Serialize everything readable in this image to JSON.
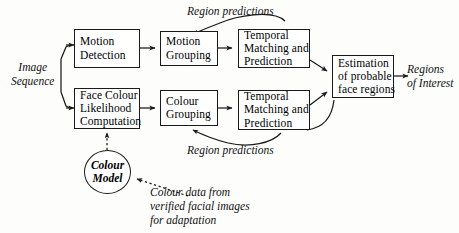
{
  "diagram": {
    "background_color": "#fdfdfb",
    "line_color": "#1a1a1a",
    "nodes": [
      {
        "id": "motion-detection",
        "shape": "box",
        "lines": [
          "Motion",
          "Detection"
        ]
      },
      {
        "id": "motion-grouping",
        "shape": "box",
        "lines": [
          "Motion",
          "Grouping"
        ]
      },
      {
        "id": "temporal-matching-top",
        "shape": "box",
        "lines": [
          "Temporal",
          "Matching and",
          "Prediction"
        ]
      },
      {
        "id": "face-colour-likelihood",
        "shape": "box",
        "lines": [
          "Face Colour",
          "Likelihood",
          "Computation"
        ]
      },
      {
        "id": "colour-grouping",
        "shape": "box",
        "lines": [
          "Colour",
          "Grouping"
        ]
      },
      {
        "id": "temporal-matching-bottom",
        "shape": "box",
        "lines": [
          "Temporal",
          "Matching and",
          "Prediction"
        ]
      },
      {
        "id": "estimation",
        "shape": "box",
        "lines": [
          "Estimation",
          "of probable",
          "face regions"
        ]
      },
      {
        "id": "colour-model",
        "shape": "ellipse",
        "lines": [
          "Colour",
          "Model"
        ]
      }
    ],
    "labels": {
      "input": [
        "Image",
        "Sequence"
      ],
      "output": [
        "Regions",
        "of Interest"
      ],
      "feedback_top": "Region predictions",
      "feedback_bottom": "Region predictions",
      "adaptation": [
        "Colour data from",
        "verified facial images",
        "for adaptation"
      ]
    }
  }
}
